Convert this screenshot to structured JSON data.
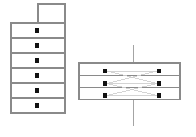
{
  "diagram": {
    "title": "",
    "background_color": "#ffffff",
    "stroke_color": "#8a8a8a",
    "node_color": "#111111",
    "link_color": "#cfcfcf",
    "axis_color": "#9a9a9a",
    "left_stack": {
      "name": "left-stack",
      "x": 11,
      "y": 23,
      "width": 54,
      "height": 90,
      "row_count": 6,
      "row_height": 15,
      "node_x": 37,
      "cap": {
        "name": "stack-cap",
        "x": 38,
        "y": 4,
        "width": 27,
        "height": 19
      },
      "rows": [
        {
          "index": 0,
          "y": 23,
          "node_y": 30.5
        },
        {
          "index": 1,
          "y": 38,
          "node_y": 45.5
        },
        {
          "index": 2,
          "y": 53,
          "node_y": 60.5
        },
        {
          "index": 3,
          "y": 68,
          "node_y": 75.5
        },
        {
          "index": 4,
          "y": 83,
          "node_y": 90.5
        },
        {
          "index": 5,
          "y": 98,
          "node_y": 105.5
        }
      ]
    },
    "right_panel": {
      "name": "right-panel",
      "x": 79,
      "y": 63,
      "width": 101,
      "height": 37,
      "row_count": 3,
      "row_height": 12.3,
      "left_node_x": 105,
      "right_node_x": 159,
      "rows": [
        {
          "index": 0,
          "y": 63,
          "node_y": 71
        },
        {
          "index": 1,
          "y": 75.3,
          "node_y": 83.5
        },
        {
          "index": 2,
          "y": 87.6,
          "node_y": 95.5
        }
      ],
      "axis": {
        "name": "vertical-axis",
        "x": 133,
        "y_top": 45,
        "y_bottom": 126
      },
      "links": [
        {
          "from_row": 0,
          "to_row": 0
        },
        {
          "from_row": 0,
          "to_row": 1
        },
        {
          "from_row": 1,
          "to_row": 0
        },
        {
          "from_row": 1,
          "to_row": 1
        },
        {
          "from_row": 1,
          "to_row": 2
        },
        {
          "from_row": 2,
          "to_row": 1
        },
        {
          "from_row": 2,
          "to_row": 2
        }
      ]
    },
    "node_radius": 2.1
  }
}
